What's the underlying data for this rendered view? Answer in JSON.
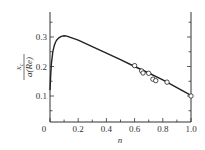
{
  "chart_data": {
    "type": "line",
    "title": "",
    "xlabel": "n",
    "ylabel": "x_c / a(Re)",
    "ylabel_parts": {
      "numerator": "x",
      "numerator_sub": "c",
      "denominator": "a(Re)"
    },
    "xlim": [
      0,
      1.0
    ],
    "ylim": [
      0.0,
      0.37
    ],
    "grid": false,
    "legend": null,
    "x_ticks": [
      0,
      0.2,
      0.4,
      0.6,
      0.8,
      1.0
    ],
    "x_tick_labels": [
      "0",
      "0.2",
      "0.4",
      "0.6",
      "0.8",
      "1.0"
    ],
    "y_ticks": [
      0.1,
      0.2,
      0.3
    ],
    "y_tick_labels": [
      "0.1",
      "0.2",
      "0.3"
    ],
    "series": [
      {
        "name": "theory curve",
        "kind": "line",
        "x": [
          0.0,
          0.005,
          0.01,
          0.02,
          0.03,
          0.04,
          0.05,
          0.06,
          0.08,
          0.1,
          0.12,
          0.2,
          0.3,
          0.4,
          0.5,
          0.6,
          0.7,
          0.8,
          0.9,
          1.0
        ],
        "y": [
          0.12,
          0.17,
          0.21,
          0.25,
          0.27,
          0.283,
          0.291,
          0.296,
          0.302,
          0.304,
          0.303,
          0.289,
          0.267,
          0.245,
          0.223,
          0.2,
          0.178,
          0.155,
          0.128,
          0.102
        ]
      },
      {
        "name": "experimental data",
        "kind": "scatter",
        "marker": "open-circle",
        "x": [
          0.6,
          0.65,
          0.66,
          0.7,
          0.73,
          0.75,
          0.83,
          1.0
        ],
        "y": [
          0.203,
          0.185,
          0.178,
          0.177,
          0.157,
          0.152,
          0.147,
          0.1
        ]
      }
    ]
  }
}
